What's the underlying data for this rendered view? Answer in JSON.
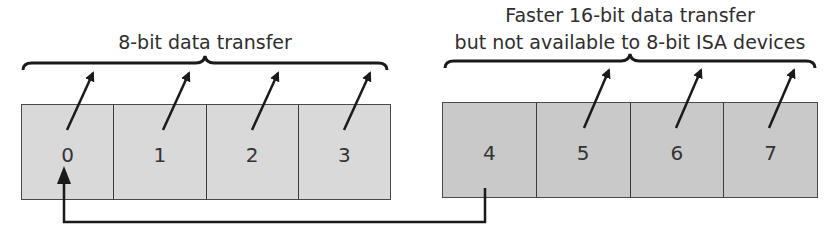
{
  "diagram": {
    "groups": [
      {
        "id": "8bit",
        "title_lines": [
          "8-bit data transfer"
        ],
        "fill": "#d9d9d9",
        "channels": [
          "0",
          "1",
          "2",
          "3"
        ]
      },
      {
        "id": "16bit",
        "title_lines": [
          "Faster 16-bit data transfer",
          "but not available to 8-bit ISA devices"
        ],
        "fill": "#c9c9c9",
        "channels": [
          "4",
          "5",
          "6",
          "7"
        ]
      }
    ],
    "cascade_connector": {
      "from": "4",
      "to": "0"
    },
    "colors": {
      "stroke": "#1a1a1a",
      "border": "#4a4a4a"
    }
  }
}
